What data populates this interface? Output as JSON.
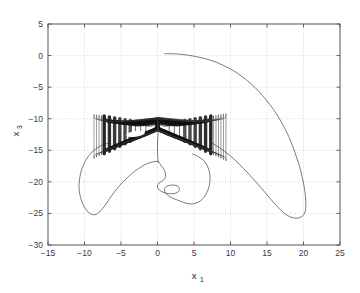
{
  "chart_data": {
    "type": "line",
    "title": "",
    "subtitle": "",
    "xlabel": "x",
    "xlabel_sub": "1",
    "ylabel": "x",
    "ylabel_sub": "3",
    "xlim": [
      -15,
      25
    ],
    "ylim": [
      -30,
      5
    ],
    "xticks": [
      -15,
      -10,
      -5,
      0,
      5,
      10,
      15,
      20,
      25
    ],
    "xticklabels": [
      "-15",
      "-10",
      "-5",
      "0",
      "5",
      "10",
      "15",
      "20",
      "25"
    ],
    "yticks": [
      -30,
      -25,
      -20,
      -15,
      -10,
      -5,
      0,
      5
    ],
    "yticklabels": [
      "-30",
      "-25",
      "-20",
      "-15",
      "-10",
      "-5",
      "0",
      "5"
    ],
    "grid": true,
    "grid_style": "dotted",
    "legend": "none",
    "line_color": "#333333",
    "attractor_color": "#111111",
    "grid_color": "#c8c8c8",
    "axis_color": "#555555",
    "background": "#ffffff",
    "series": [
      {
        "name": "transient-outer-right",
        "comment": "Starts near (1,0.3), sweeps clockwise right and down to (20,-25.5), returns toward attractor",
        "points": [
          [
            1.0,
            0.3
          ],
          [
            2.2,
            0.28
          ],
          [
            3.6,
            0.15
          ],
          [
            5.0,
            -0.1
          ],
          [
            6.4,
            -0.45
          ],
          [
            7.8,
            -0.95
          ],
          [
            9.1,
            -1.6
          ],
          [
            10.4,
            -2.4
          ],
          [
            11.6,
            -3.35
          ],
          [
            12.8,
            -4.45
          ],
          [
            13.9,
            -5.7
          ],
          [
            14.9,
            -7.05
          ],
          [
            15.9,
            -8.55
          ],
          [
            16.8,
            -10.2
          ],
          [
            17.6,
            -11.9
          ],
          [
            18.3,
            -13.7
          ],
          [
            18.9,
            -15.6
          ],
          [
            19.45,
            -17.5
          ],
          [
            19.85,
            -19.4
          ],
          [
            20.15,
            -21.2
          ],
          [
            20.3,
            -22.9
          ],
          [
            20.3,
            -24.2
          ],
          [
            20.1,
            -25.1
          ],
          [
            19.6,
            -25.6
          ],
          [
            18.9,
            -25.75
          ],
          [
            18.1,
            -25.5
          ],
          [
            17.3,
            -24.9
          ],
          [
            16.4,
            -23.9
          ],
          [
            15.4,
            -22.6
          ],
          [
            14.3,
            -21.1
          ],
          [
            13.1,
            -19.5
          ],
          [
            11.8,
            -17.9
          ],
          [
            10.5,
            -16.4
          ],
          [
            9.2,
            -15.2
          ],
          [
            8.1,
            -14.3
          ],
          [
            7.2,
            -13.7
          ]
        ]
      },
      {
        "name": "transient-outer-left",
        "comment": "Left wing sweeping from attractor region down to (-10,-25.2) and back up",
        "points": [
          [
            -6.8,
            -13.9
          ],
          [
            -7.8,
            -14.3
          ],
          [
            -8.7,
            -15.0
          ],
          [
            -9.5,
            -16.0
          ],
          [
            -10.1,
            -17.2
          ],
          [
            -10.5,
            -18.5
          ],
          [
            -10.7,
            -19.8
          ],
          [
            -10.75,
            -21.0
          ],
          [
            -10.6,
            -22.2
          ],
          [
            -10.3,
            -23.3
          ],
          [
            -9.9,
            -24.2
          ],
          [
            -9.4,
            -24.9
          ],
          [
            -8.9,
            -25.2
          ],
          [
            -8.4,
            -25.15
          ],
          [
            -8.0,
            -24.8
          ],
          [
            -7.5,
            -24.2
          ],
          [
            -7.0,
            -23.4
          ],
          [
            -6.4,
            -22.4
          ],
          [
            -5.7,
            -21.3
          ],
          [
            -4.9,
            -20.2
          ],
          [
            -4.0,
            -19.2
          ],
          [
            -3.1,
            -18.3
          ],
          [
            -2.2,
            -17.6
          ],
          [
            -1.4,
            -17.1
          ],
          [
            -0.7,
            -16.85
          ],
          [
            -0.2,
            -16.75
          ],
          [
            0.1,
            -16.8
          ]
        ]
      },
      {
        "name": "transient-inner-lower",
        "comment": "Inner S-shaped curve from the central spike, hooking right and down to (5,-23.5)",
        "points": [
          [
            0.1,
            -16.8
          ],
          [
            0.5,
            -17.4
          ],
          [
            0.9,
            -18.1
          ],
          [
            1.1,
            -18.8
          ],
          [
            1.0,
            -19.5
          ],
          [
            0.6,
            -19.9
          ],
          [
            0.2,
            -20.2
          ],
          [
            0.0,
            -20.6
          ],
          [
            0.1,
            -21.1
          ],
          [
            0.5,
            -21.5
          ],
          [
            1.2,
            -21.8
          ],
          [
            2.0,
            -21.9
          ],
          [
            2.7,
            -21.7
          ],
          [
            3.0,
            -21.2
          ],
          [
            2.8,
            -20.7
          ],
          [
            2.2,
            -20.5
          ],
          [
            1.5,
            -20.6
          ],
          [
            1.0,
            -21.0
          ],
          [
            1.0,
            -21.6
          ],
          [
            1.5,
            -22.2
          ],
          [
            2.3,
            -22.7
          ],
          [
            3.2,
            -23.1
          ],
          [
            4.0,
            -23.4
          ],
          [
            4.7,
            -23.5
          ],
          [
            5.3,
            -23.35
          ],
          [
            5.9,
            -23.0
          ],
          [
            6.4,
            -22.4
          ],
          [
            6.8,
            -21.6
          ],
          [
            7.1,
            -20.6
          ],
          [
            7.2,
            -19.5
          ],
          [
            7.1,
            -18.4
          ],
          [
            6.8,
            -17.4
          ],
          [
            6.3,
            -16.6
          ],
          [
            5.6,
            -16.0
          ],
          [
            4.8,
            -15.6
          ]
        ]
      },
      {
        "name": "central-spike",
        "comment": "Near-vertical segment at x approximately 0 descending from the attractor cusp",
        "points": [
          [
            0.15,
            -10.4
          ],
          [
            0.1,
            -11.6
          ],
          [
            0.05,
            -12.8
          ],
          [
            0.0,
            -14.0
          ],
          [
            0.0,
            -15.2
          ],
          [
            0.05,
            -16.4
          ],
          [
            0.1,
            -16.9
          ]
        ]
      },
      {
        "name": "chaotic-attractor",
        "comment": "Dense filled double-lobed crescent; left lobe x in [-7,0], right lobe x in [0,7], y in [-15,-10], with a small void near (-3,-12.5)",
        "x_range": [
          -7.2,
          7.4
        ],
        "y_range": [
          -15.2,
          -10.0
        ],
        "void_center": [
          -3.0,
          -12.4
        ],
        "void_size": [
          1.3,
          0.45
        ],
        "cusp": [
          0.0,
          -10.0
        ],
        "band_count": 9
      }
    ]
  }
}
